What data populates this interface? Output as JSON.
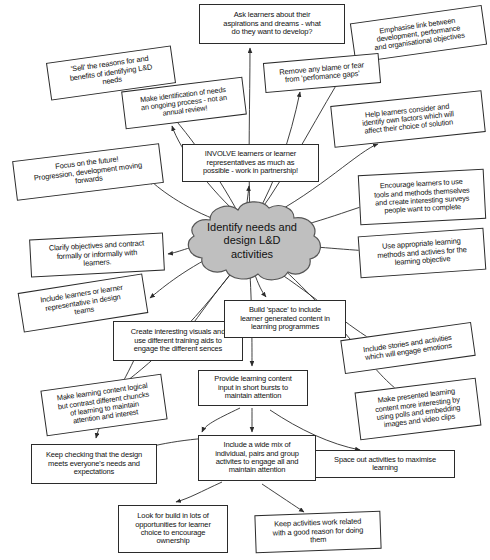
{
  "diagram": {
    "type": "mind-map",
    "title_center": "Identify needs and\ndesign L&D\nactivities",
    "center_fill": "#bfbfbf",
    "center_stroke": "#555555",
    "node_stroke": "#2b2b2b",
    "node_fill": "#ffffff",
    "nodes": [
      {
        "id": "n1",
        "text": "Ask learners about their\naspirations and dreams - what\ndo they want to develop?",
        "x": 199,
        "y": 4,
        "w": 146,
        "h": 40,
        "rot": 0,
        "font": 7.6
      },
      {
        "id": "n2",
        "text": "Emphasise link between\ndevelopment, performance\nand organisational objectives",
        "x": 352,
        "y": 14,
        "w": 133,
        "h": 40,
        "rot": -8,
        "font": 7.4
      },
      {
        "id": "n3",
        "text": "Remove any blame or fear\nfrom 'perfomance gaps'",
        "x": 264,
        "y": 58,
        "w": 116,
        "h": 30,
        "rot": -5,
        "font": 7.5
      },
      {
        "id": "n4",
        "text": "'Sell' the reasons for and\nbenefits of identifying L&D\nneeds",
        "x": 48,
        "y": 54,
        "w": 126,
        "h": 38,
        "rot": -8,
        "font": 7.5
      },
      {
        "id": "n5",
        "text": "Help learners consider and\nidentify own factors which will\naffect their choice of solution",
        "x": 332,
        "y": 98,
        "w": 152,
        "h": 42,
        "rot": -6,
        "font": 7.4
      },
      {
        "id": "n6",
        "text": "Make identification of needs\nan ongoing process - not an\nannual review!",
        "x": 123,
        "y": 84,
        "w": 122,
        "h": 38,
        "rot": -7,
        "font": 7.3
      },
      {
        "id": "n7",
        "text": "INVOLVE learners or learner\nrepresentatives as much as\npossible - work in partnership!",
        "x": 182,
        "y": 144,
        "w": 137,
        "h": 38,
        "rot": 0,
        "font": 7.5
      },
      {
        "id": "n8",
        "text": "Focus on the future!\nProgression, development moving\nforwards",
        "x": 14,
        "y": 152,
        "w": 148,
        "h": 40,
        "rot": -7,
        "font": 7.5
      },
      {
        "id": "n9",
        "text": "Encourage learners to use\ntools and methods themselves\nand create interesting surveys\npeople want to complete",
        "x": 359,
        "y": 172,
        "w": 126,
        "h": 50,
        "rot": -3,
        "font": 7.4
      },
      {
        "id": "n10",
        "text": "Use appropriate learning\nmethods and activies for the\nlearning objective",
        "x": 359,
        "y": 232,
        "w": 126,
        "h": 42,
        "rot": -4,
        "font": 7.5
      },
      {
        "id": "n11",
        "text": "Clarify objectives and contract\nformally or informally with\nlearners.",
        "x": 30,
        "y": 236,
        "w": 134,
        "h": 38,
        "rot": -3,
        "font": 7.5
      },
      {
        "id": "n12",
        "text": "Include learners or learner\nrepresentative in design\nteams",
        "x": 20,
        "y": 283,
        "w": 126,
        "h": 40,
        "rot": -9,
        "font": 7.5
      },
      {
        "id": "n13",
        "text": "Create interesting visuals and\nuse different training aids to\nengage the different sences",
        "x": 113,
        "y": 321,
        "w": 130,
        "h": 40,
        "rot": 0,
        "font": 7.5
      },
      {
        "id": "n14",
        "text": "Build 'space' to include\nlearner generated content in\nlearning programmes",
        "x": 224,
        "y": 300,
        "w": 122,
        "h": 38,
        "rot": 0,
        "font": 7.5
      },
      {
        "id": "n15",
        "text": "Include stories and activities\nwhich will engage emotions",
        "x": 342,
        "y": 331,
        "w": 132,
        "h": 34,
        "rot": -8,
        "font": 7.5
      },
      {
        "id": "n16",
        "text": "Make presented learning\ncontent more interesting by\nusing polls and embedding\nimages and video clips",
        "x": 357,
        "y": 385,
        "w": 122,
        "h": 48,
        "rot": -7,
        "font": 7.4
      },
      {
        "id": "n17",
        "text": "Make learning content logical\nbut contrast different chuncks\nof learning to maintain\nattention and interest",
        "x": 43,
        "y": 382,
        "w": 122,
        "h": 46,
        "rot": -8,
        "font": 7.4
      },
      {
        "id": "n18",
        "text": "Provide learning content\ninput in short bursts to\nmaintain attention",
        "x": 198,
        "y": 370,
        "w": 110,
        "h": 36,
        "rot": 0,
        "font": 7.5
      },
      {
        "id": "n19",
        "text": "Include a wide mix of\nindividual, pairs and group\nactivites to engage all and\nmaintain attention",
        "x": 198,
        "y": 435,
        "w": 118,
        "h": 46,
        "rot": 0,
        "font": 7.5
      },
      {
        "id": "n20",
        "text": "Keep checking that the design\nmeets everyone's needs and\nexpectations",
        "x": 31,
        "y": 444,
        "w": 126,
        "h": 40,
        "rot": 0,
        "font": 7.5
      },
      {
        "id": "n21",
        "text": "Space out activities to maximise\nlearning",
        "x": 315,
        "y": 450,
        "w": 140,
        "h": 28,
        "rot": 0,
        "font": 7.5
      },
      {
        "id": "n22",
        "text": "Look for build in lots of\nopportunities for learner\nchoice to encourage\nownership",
        "x": 118,
        "y": 505,
        "w": 110,
        "h": 48,
        "rot": 0,
        "font": 7.5
      },
      {
        "id": "n23",
        "text": "Keep activities work related\nwith a good reason for doing\nthem",
        "x": 255,
        "y": 513,
        "w": 126,
        "h": 38,
        "rot": -2,
        "font": 7.5
      }
    ]
  }
}
